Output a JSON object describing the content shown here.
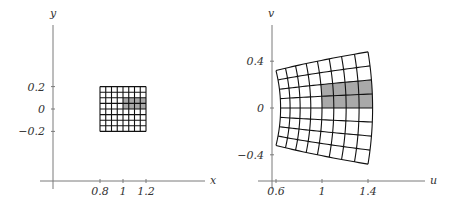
{
  "figure": {
    "colors": {
      "grid": "#111111",
      "shade": "#a9a9a9",
      "axis": "#7a7a7a",
      "text": "#333333"
    }
  },
  "left_plot": {
    "x_axis_label": "x",
    "y_axis_label": "y",
    "x_ticks": [
      {
        "value": 0.8,
        "label": "0.8"
      },
      {
        "value": 1,
        "label": "1"
      },
      {
        "value": 1.2,
        "label": "1.2"
      }
    ],
    "y_ticks": [
      {
        "value": 0.2,
        "label": "0.2"
      },
      {
        "value": 0,
        "label": "0"
      },
      {
        "value": -0.2,
        "label": "−0.2"
      }
    ],
    "grid": {
      "x_range": [
        0.8,
        1.2
      ],
      "y_range": [
        -0.2,
        0.2
      ],
      "divisions": 8
    },
    "shaded": {
      "x_range": [
        1.0,
        1.2
      ],
      "y_range": [
        0.0,
        0.1
      ]
    }
  },
  "right_plot": {
    "x_axis_label": "u",
    "y_axis_label": "v",
    "x_ticks": [
      {
        "value": 0.6,
        "label": "0.6"
      },
      {
        "value": 1,
        "label": "1"
      },
      {
        "value": 1.4,
        "label": "1.4"
      }
    ],
    "y_ticks": [
      {
        "value": 0.4,
        "label": "0.4"
      },
      {
        "value": 0,
        "label": "0"
      },
      {
        "value": -0.4,
        "label": "−0.4"
      }
    ],
    "mapping": "u = x^2 - y^2, v = 2xy",
    "image_corners": [
      {
        "x": 0.8,
        "y": 0.2,
        "u": 0.6,
        "v": 0.32
      },
      {
        "x": 1.2,
        "y": 0.2,
        "u": 1.4,
        "v": 0.48
      },
      {
        "x": 0.8,
        "y": -0.2,
        "u": 0.6,
        "v": -0.32
      },
      {
        "x": 1.2,
        "y": -0.2,
        "u": 1.4,
        "v": -0.48
      }
    ]
  }
}
